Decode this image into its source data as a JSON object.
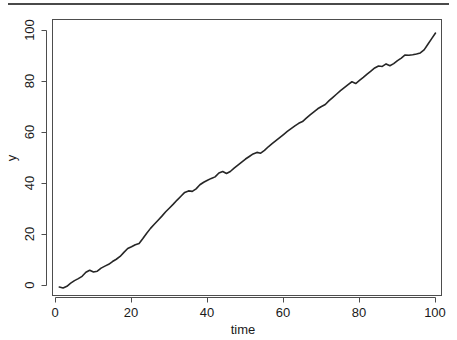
{
  "figure": {
    "background_color": "#ffffff",
    "top_rule_color": "#4a4a4a",
    "line_color": "#262626",
    "axis_color": "#4d4d4d"
  },
  "chart_data": {
    "type": "line",
    "title": "",
    "subtitle": "",
    "xlabel": "time",
    "ylabel": "y",
    "xlim": [
      1,
      100
    ],
    "ylim": [
      -1.5,
      99.5
    ],
    "xticks": [
      0,
      20,
      40,
      60,
      80,
      100
    ],
    "yticks": [
      0,
      20,
      40,
      60,
      80,
      100
    ],
    "xtick_labels": [
      "0",
      "20",
      "40",
      "60",
      "80",
      "100"
    ],
    "ytick_labels": [
      "0",
      "20",
      "40",
      "60",
      "80",
      "100"
    ],
    "ytick_label_rotation": 90,
    "grid": false,
    "legend": false,
    "legend_position": "none",
    "series": [
      {
        "name": "y",
        "color": "#262626",
        "x": [
          1,
          2,
          3,
          4,
          5,
          6,
          7,
          8,
          9,
          10,
          11,
          12,
          13,
          14,
          15,
          16,
          17,
          18,
          19,
          20,
          21,
          22,
          23,
          24,
          25,
          26,
          27,
          28,
          29,
          30,
          31,
          32,
          33,
          34,
          35,
          36,
          37,
          38,
          39,
          40,
          41,
          42,
          43,
          44,
          45,
          46,
          47,
          48,
          49,
          50,
          51,
          52,
          53,
          54,
          55,
          56,
          57,
          58,
          59,
          60,
          61,
          62,
          63,
          64,
          65,
          66,
          67,
          68,
          69,
          70,
          71,
          72,
          73,
          74,
          75,
          76,
          77,
          78,
          79,
          80,
          81,
          82,
          83,
          84,
          85,
          86,
          87,
          88,
          89,
          90,
          91,
          92,
          93,
          94,
          95,
          96,
          97,
          98,
          99,
          100
        ],
        "values": [
          -0.6,
          -1.0,
          -0.3,
          0.9,
          1.9,
          2.7,
          3.6,
          5.2,
          6.0,
          5.3,
          5.6,
          6.8,
          7.6,
          8.3,
          9.4,
          10.3,
          11.4,
          13.0,
          14.5,
          15.2,
          16.0,
          16.5,
          18.4,
          20.5,
          22.4,
          24.0,
          25.6,
          27.2,
          28.9,
          30.4,
          31.9,
          33.5,
          35.0,
          36.5,
          37.1,
          36.9,
          37.9,
          39.5,
          40.5,
          41.3,
          42.0,
          42.6,
          44.1,
          44.7,
          43.9,
          44.7,
          46.0,
          47.2,
          48.4,
          49.6,
          50.6,
          51.6,
          52.2,
          51.9,
          53.0,
          54.4,
          55.6,
          56.8,
          58.0,
          59.2,
          60.4,
          61.5,
          62.6,
          63.6,
          64.3,
          65.6,
          66.9,
          68.1,
          69.3,
          70.2,
          71.0,
          72.5,
          73.8,
          75.1,
          76.4,
          77.6,
          78.8,
          79.9,
          79.2,
          80.4,
          81.6,
          82.9,
          84.1,
          85.3,
          86.1,
          85.9,
          86.9,
          86.2,
          87.0,
          88.2,
          89.2,
          90.4,
          90.3,
          90.5,
          90.8,
          91.2,
          92.4,
          94.6,
          96.8,
          99.0
        ]
      }
    ]
  }
}
